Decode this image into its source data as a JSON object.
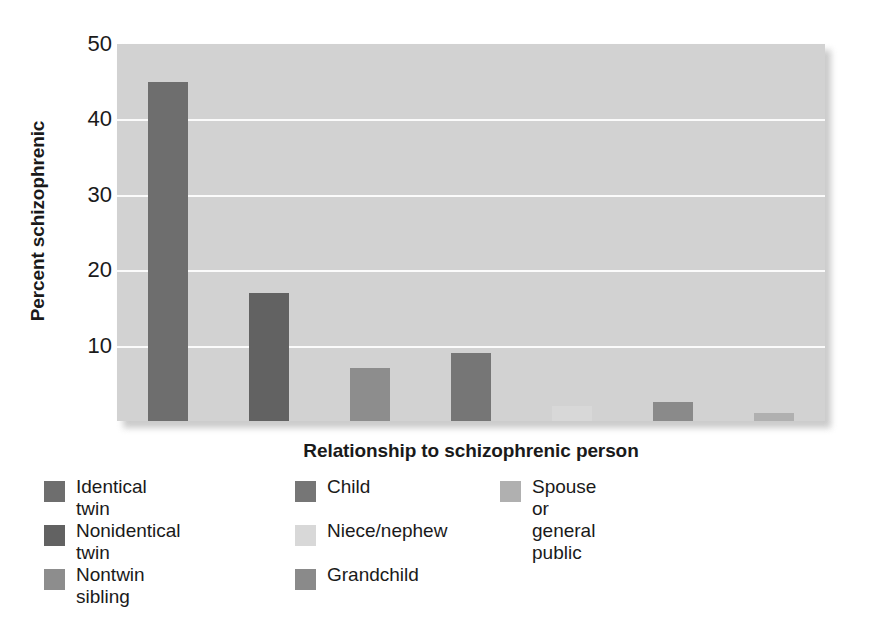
{
  "chart_data": {
    "type": "bar",
    "title": "",
    "xlabel": "Relationship to schizophrenic person",
    "ylabel": "Percent schizophrenic",
    "ylim": [
      0,
      50
    ],
    "yticks": [
      10,
      20,
      30,
      40,
      50
    ],
    "grid": true,
    "legend_position": "bottom",
    "categories": [
      "Identical twin",
      "Nonidentical twin",
      "Nontwin sibling",
      "Child",
      "Niece/nephew",
      "Grandchild",
      "Spouse or general public"
    ],
    "values": [
      45,
      17,
      7,
      9,
      2,
      2.5,
      1
    ],
    "colors": [
      "#6e6e6e",
      "#626262",
      "#8d8d8d",
      "#767676",
      "#d8d8d8",
      "#8a8a8a",
      "#b0b0b0"
    ]
  },
  "axes": {
    "y_title": "Percent schizophrenic",
    "x_title": "Relationship to schizophrenic person",
    "y_ticks": [
      "50",
      "40",
      "30",
      "20",
      "10"
    ]
  },
  "legend": {
    "columns": [
      {
        "items": [
          {
            "label": "Identical twin",
            "color": "#6e6e6e"
          },
          {
            "label": "Nonidentical twin",
            "color": "#626262"
          },
          {
            "label": "Nontwin sibling",
            "color": "#8d8d8d"
          }
        ]
      },
      {
        "items": [
          {
            "label": "Child",
            "color": "#767676"
          },
          {
            "label": "Niece/nephew",
            "color": "#d8d8d8"
          },
          {
            "label": "Grandchild",
            "color": "#8a8a8a"
          }
        ]
      },
      {
        "items": [
          {
            "label": "Spouse or\ngeneral public",
            "color": "#b0b0b0"
          }
        ]
      }
    ]
  },
  "colors": {
    "plot_background": "#d2d2d2",
    "gridline": "#fbfbfb",
    "text": "#1a1a1a",
    "page_background": "#ffffff"
  }
}
